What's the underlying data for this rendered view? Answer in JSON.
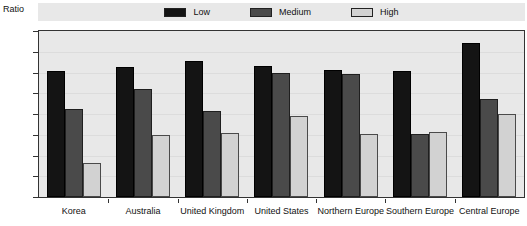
{
  "chart_data": {
    "type": "bar",
    "title": "",
    "xlabel": "",
    "ylabel": "Ratio",
    "ylim": [
      0.0,
      1.6
    ],
    "ytick_labels": [
      "0.0",
      "0.2",
      "0.4",
      "0.6",
      "0.8",
      "1.0",
      "1.2",
      "1.4",
      "1.6"
    ],
    "ytick_values": [
      0.0,
      0.2,
      0.4,
      0.6,
      0.8,
      1.0,
      1.2,
      1.4,
      1.6
    ],
    "grid": true,
    "legend_position": "top-center",
    "categories": [
      "Korea",
      "Australia",
      "United Kingdom",
      "United States",
      "Northern Europe",
      "Southern Europe",
      "Central Europe"
    ],
    "series": [
      {
        "name": "Low",
        "color": "#141414",
        "values": [
          1.21,
          1.25,
          1.31,
          1.26,
          1.22,
          1.21,
          1.48
        ]
      },
      {
        "name": "Medium",
        "color": "#4a4a4a",
        "values": [
          0.85,
          1.04,
          0.83,
          1.2,
          1.19,
          0.61,
          0.94
        ]
      },
      {
        "name": "High",
        "color": "#d2d2d2",
        "values": [
          0.33,
          0.6,
          0.62,
          0.78,
          0.61,
          0.63,
          0.8
        ]
      }
    ]
  },
  "legend": {
    "entries": [
      {
        "label": "Low"
      },
      {
        "label": "Medium"
      },
      {
        "label": "High"
      }
    ]
  },
  "colors": {
    "low": "#141414",
    "medium": "#4a4a4a",
    "high": "#d2d2d2",
    "plot_background": "#e8e8e8",
    "page_background": "#ffffff",
    "frame": "#333333",
    "gridline": "#dcdcdc"
  }
}
